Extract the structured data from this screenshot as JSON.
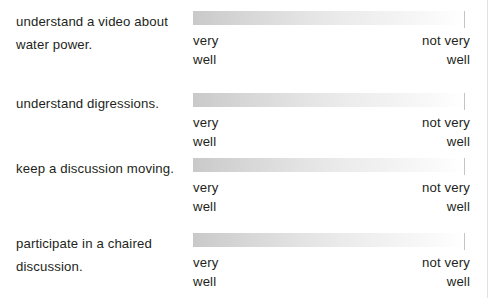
{
  "survey": {
    "scale": {
      "low_anchor": "very\nwell",
      "high_anchor": "not very\nwell"
    },
    "items": [
      {
        "statement": "understand a video about water power.",
        "low_anchor": "very\nwell",
        "high_anchor": "not very\nwell"
      },
      {
        "statement": "understand digressions.",
        "low_anchor": "very\nwell",
        "high_anchor": "not very\nwell"
      },
      {
        "statement": "keep a discussion moving.",
        "low_anchor": "very\nwell",
        "high_anchor": "not very\nwell"
      },
      {
        "statement": "participate in a chaired discussion.",
        "low_anchor": "very\nwell",
        "high_anchor": "not very\nwell"
      }
    ]
  },
  "colors": {
    "text": "#231f20",
    "bar_gradient_start": "#c9c9c9",
    "bar_gradient_end": "#ffffff",
    "bar_endcap": "#c4c4c4",
    "page_rule": "#e2e2e2",
    "background": "#ffffff"
  }
}
